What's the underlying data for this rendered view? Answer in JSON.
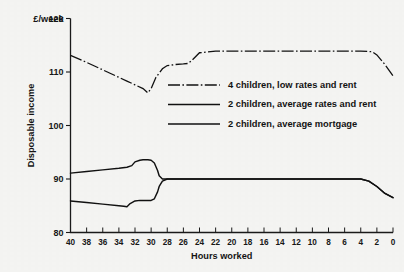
{
  "chart_data": {
    "type": "line",
    "title": "",
    "xlabel": "Hours worked",
    "ylabel": "Disposable income",
    "y_unit_label": "£/week",
    "xlim": [
      40,
      0
    ],
    "ylim": [
      80,
      120
    ],
    "x_tick_labels": [
      "40",
      "38",
      "36",
      "34",
      "32",
      "30",
      "28",
      "26",
      "24",
      "22",
      "20",
      "18",
      "16",
      "14",
      "12",
      "10",
      "8",
      "6",
      "4",
      "2",
      "0"
    ],
    "x_ticks": [
      40,
      38,
      36,
      34,
      32,
      30,
      28,
      26,
      24,
      22,
      20,
      18,
      16,
      14,
      12,
      10,
      8,
      6,
      4,
      2,
      0
    ],
    "y_tick_labels": [
      "80",
      "90",
      "100",
      "110",
      "120"
    ],
    "y_ticks": [
      80,
      90,
      100,
      110,
      120
    ],
    "grid": false,
    "x_axis_direction": "descending",
    "legend_position": "inside-upper-right",
    "series": [
      {
        "name": "4 children, low rates and rent",
        "style": "dash-dot",
        "x": [
          40,
          38,
          36,
          34,
          33,
          32,
          31,
          30.4,
          30,
          29.4,
          28.6,
          28,
          27,
          26,
          25.4,
          25,
          24,
          22,
          20,
          18,
          16,
          14,
          12,
          10,
          8,
          6,
          4,
          2.6,
          2,
          1,
          0
        ],
        "values": [
          113.1,
          111.8,
          110.4,
          109.0,
          108.3,
          107.6,
          106.9,
          106.1,
          106.9,
          109.0,
          110.6,
          111.2,
          111.4,
          111.5,
          111.6,
          112.1,
          113.6,
          113.9,
          113.9,
          113.9,
          113.9,
          113.9,
          113.9,
          113.9,
          113.9,
          113.9,
          113.9,
          113.8,
          113.2,
          111.4,
          109.3
        ]
      },
      {
        "name": "2 children, average rates and rent",
        "style": "solid",
        "x": [
          40,
          38,
          36,
          34,
          33,
          32.4,
          32,
          31.4,
          31,
          30.4,
          30,
          29.6,
          29.2,
          29,
          28.6,
          28,
          26,
          24,
          22,
          20,
          18,
          16,
          14,
          12,
          10,
          8,
          6,
          4,
          3,
          2,
          1,
          0
        ],
        "values": [
          91.1,
          91.4,
          91.7,
          92.0,
          92.2,
          92.5,
          93.2,
          93.5,
          93.6,
          93.6,
          93.5,
          93.0,
          91.6,
          90.6,
          90.0,
          90.0,
          90.0,
          90.0,
          90.0,
          90.0,
          90.0,
          90.0,
          90.0,
          90.0,
          90.0,
          90.0,
          90.0,
          90.0,
          89.6,
          88.6,
          87.3,
          86.5
        ]
      },
      {
        "name": "2 children, average mortgage",
        "style": "solid",
        "x": [
          40,
          38,
          36,
          34,
          33.4,
          33,
          32.6,
          32,
          31.4,
          31,
          30.6,
          30,
          29.6,
          29.2,
          29,
          28.6,
          28,
          26,
          24,
          22,
          20,
          18,
          16,
          14,
          12,
          10,
          8,
          6,
          4,
          3,
          2,
          1,
          0
        ],
        "values": [
          85.9,
          85.6,
          85.3,
          85.0,
          84.9,
          84.8,
          85.4,
          85.9,
          86.0,
          86.0,
          86.0,
          86.0,
          86.3,
          87.6,
          88.6,
          89.6,
          90.0,
          90.0,
          90.0,
          90.0,
          90.0,
          90.0,
          90.0,
          90.0,
          90.0,
          90.0,
          90.0,
          90.0,
          90.0,
          89.6,
          88.6,
          87.3,
          86.5
        ]
      }
    ],
    "legend_entries": [
      "4 children, low rates and rent",
      "2 children, average rates and rent",
      "2 children, average mortgage"
    ]
  },
  "colors": {
    "ink": "#111111",
    "background": "#f4f4f2"
  }
}
